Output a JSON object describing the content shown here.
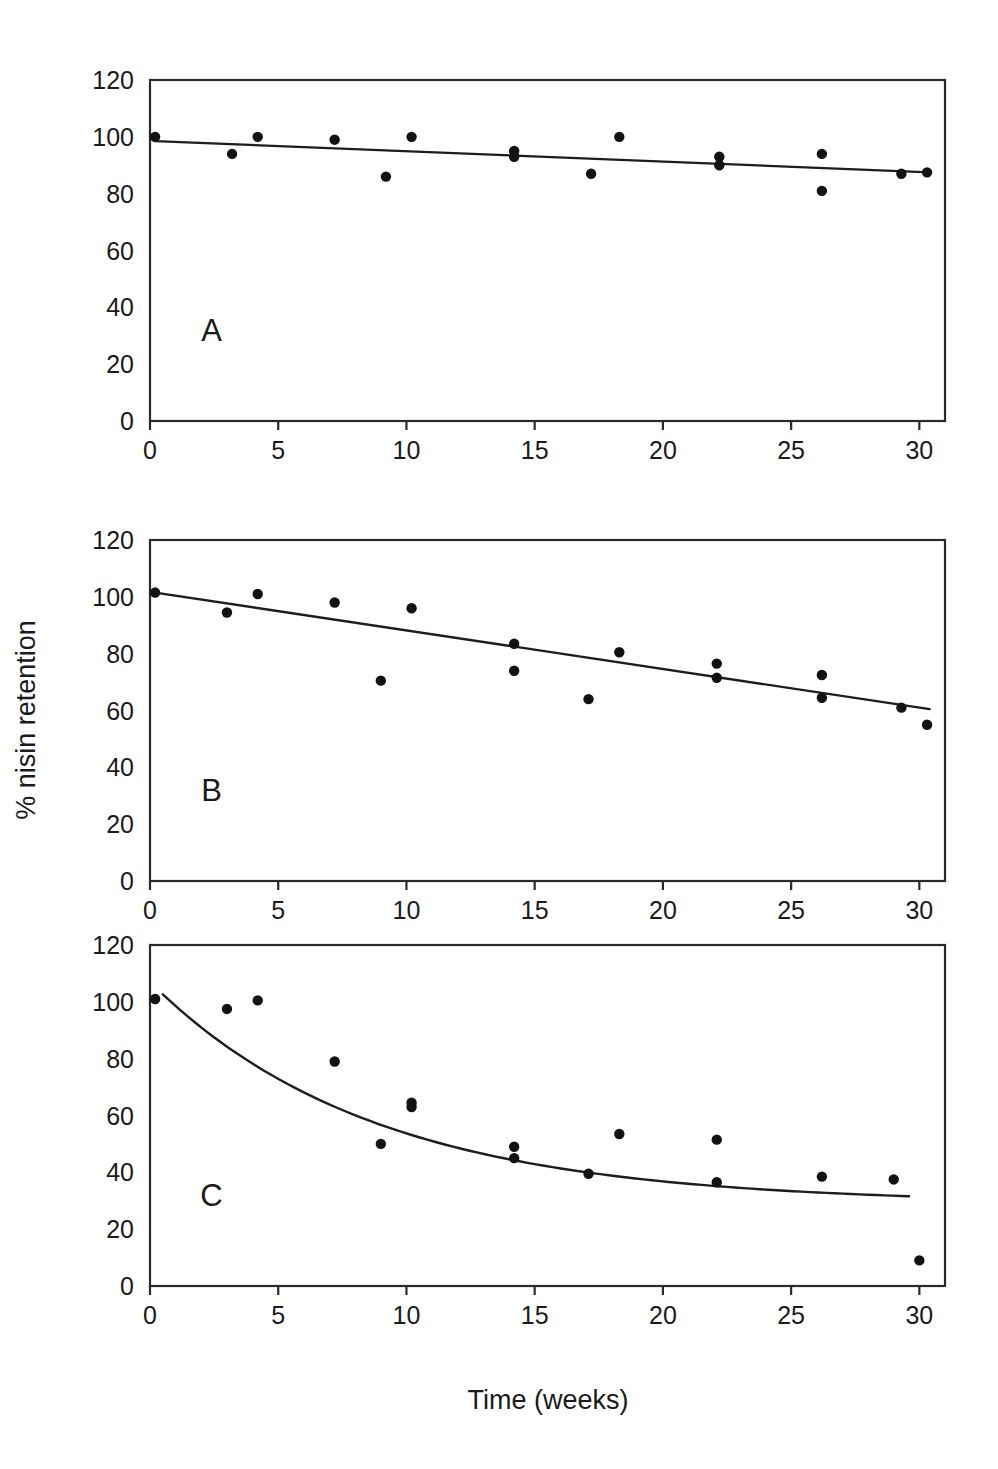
{
  "figure": {
    "ylabel": "% nisin retention",
    "xlabel": "Time (weeks)"
  },
  "chart_data": [
    {
      "type": "scatter",
      "panel": "A",
      "title": "",
      "xlabel": "Time (weeks)",
      "ylabel": "% nisin retention",
      "xlim": [
        0,
        31
      ],
      "ylim": [
        0,
        120
      ],
      "xticks": [
        0,
        5,
        10,
        15,
        20,
        25,
        30
      ],
      "yticks": [
        0,
        20,
        40,
        60,
        80,
        100,
        120
      ],
      "grid": false,
      "legend": "none",
      "points": [
        {
          "x": 0.2,
          "y": 100
        },
        {
          "x": 3.2,
          "y": 94
        },
        {
          "x": 4.2,
          "y": 100
        },
        {
          "x": 7.2,
          "y": 99
        },
        {
          "x": 9.2,
          "y": 86
        },
        {
          "x": 10.2,
          "y": 100
        },
        {
          "x": 14.2,
          "y": 95
        },
        {
          "x": 14.2,
          "y": 93
        },
        {
          "x": 17.2,
          "y": 87
        },
        {
          "x": 18.3,
          "y": 100
        },
        {
          "x": 22.2,
          "y": 93
        },
        {
          "x": 22.2,
          "y": 90
        },
        {
          "x": 26.2,
          "y": 94
        },
        {
          "x": 26.2,
          "y": 81
        },
        {
          "x": 29.3,
          "y": 87
        },
        {
          "x": 30.3,
          "y": 87.5
        }
      ],
      "fit": {
        "kind": "linear",
        "label": "linear trend",
        "x0": 0.2,
        "x1": 30.4,
        "y0": 98.5,
        "y1": 87.5
      }
    },
    {
      "type": "scatter",
      "panel": "B",
      "title": "",
      "xlabel": "Time (weeks)",
      "ylabel": "% nisin retention",
      "xlim": [
        0,
        31
      ],
      "ylim": [
        0,
        120
      ],
      "xticks": [
        0,
        5,
        10,
        15,
        20,
        25,
        30
      ],
      "yticks": [
        0,
        20,
        40,
        60,
        80,
        100,
        120
      ],
      "grid": false,
      "legend": "none",
      "points": [
        {
          "x": 0.2,
          "y": 101.5
        },
        {
          "x": 3.0,
          "y": 94.5
        },
        {
          "x": 4.2,
          "y": 101
        },
        {
          "x": 7.2,
          "y": 98
        },
        {
          "x": 9.0,
          "y": 70.5
        },
        {
          "x": 10.2,
          "y": 96
        },
        {
          "x": 14.2,
          "y": 83.5
        },
        {
          "x": 14.2,
          "y": 74
        },
        {
          "x": 17.1,
          "y": 64
        },
        {
          "x": 18.3,
          "y": 80.5
        },
        {
          "x": 22.1,
          "y": 76.5
        },
        {
          "x": 22.1,
          "y": 71.5
        },
        {
          "x": 26.2,
          "y": 72.5
        },
        {
          "x": 26.2,
          "y": 64.5
        },
        {
          "x": 29.3,
          "y": 61
        },
        {
          "x": 30.3,
          "y": 55
        }
      ],
      "fit": {
        "kind": "linear",
        "label": "linear trend",
        "x0": 0.2,
        "x1": 30.4,
        "y0": 101.5,
        "y1": 60.5
      }
    },
    {
      "type": "scatter",
      "panel": "C",
      "title": "",
      "xlabel": "Time (weeks)",
      "ylabel": "% nisin retention",
      "xlim": [
        0,
        31
      ],
      "ylim": [
        0,
        120
      ],
      "xticks": [
        0,
        5,
        10,
        15,
        20,
        25,
        30
      ],
      "yticks": [
        0,
        20,
        40,
        60,
        80,
        100,
        120
      ],
      "grid": false,
      "legend": "none",
      "points": [
        {
          "x": 0.2,
          "y": 101
        },
        {
          "x": 3.0,
          "y": 97.5
        },
        {
          "x": 4.2,
          "y": 100.5
        },
        {
          "x": 7.2,
          "y": 79
        },
        {
          "x": 9.0,
          "y": 50
        },
        {
          "x": 10.2,
          "y": 64.5
        },
        {
          "x": 10.2,
          "y": 63
        },
        {
          "x": 14.2,
          "y": 49
        },
        {
          "x": 14.2,
          "y": 45
        },
        {
          "x": 17.1,
          "y": 39.5
        },
        {
          "x": 18.3,
          "y": 53.5
        },
        {
          "x": 22.1,
          "y": 51.5
        },
        {
          "x": 22.1,
          "y": 36.5
        },
        {
          "x": 26.2,
          "y": 38.5
        },
        {
          "x": 29.0,
          "y": 37.5
        },
        {
          "x": 30.0,
          "y": 9
        }
      ],
      "fit": {
        "kind": "exponential-decay",
        "label": "exponential decay",
        "x0": 0.5,
        "x1": 29.6,
        "asymptote": 29,
        "amplitude": 78,
        "rate": 0.115
      }
    }
  ],
  "panels": {
    "a_letter": "A",
    "b_letter": "B",
    "c_letter": "C"
  },
  "colors": {
    "axis": "#2a2a2a",
    "point": "#121212",
    "line": "#1d1d1d",
    "background": "#ffffff"
  }
}
